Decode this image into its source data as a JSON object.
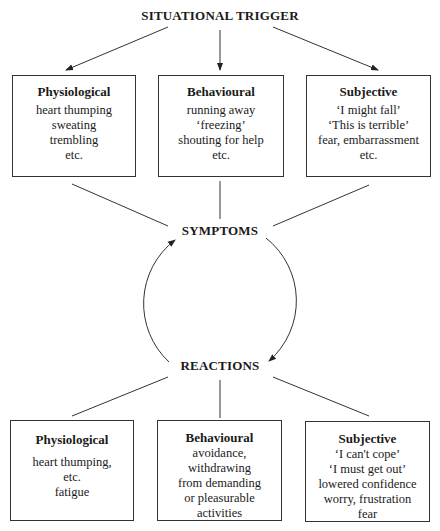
{
  "diagram": {
    "trigger": "SITUATIONAL TRIGGER",
    "symptoms": "SYMPTOMS",
    "reactions": "REACTIONS",
    "top_boxes": [
      {
        "heading": "Physiological",
        "lines": [
          "heart thumping",
          "sweating",
          "trembling",
          "etc."
        ]
      },
      {
        "heading": "Behavioural",
        "lines": [
          "running away",
          "‘freezing’",
          "shouting for help",
          "etc."
        ]
      },
      {
        "heading": "Subjective",
        "lines": [
          "‘I might fall’",
          "‘This is terrible’",
          "fear, embarrassment",
          "etc."
        ]
      }
    ],
    "bottom_boxes": [
      {
        "heading": "Physiological",
        "lines": [
          "heart thumping,",
          "etc.",
          "fatigue"
        ]
      },
      {
        "heading": "Behavioural",
        "lines": [
          "avoidance,",
          "withdrawing",
          "from demanding",
          "or pleasurable",
          "activities"
        ]
      },
      {
        "heading": "Subjective",
        "lines": [
          "‘I can't cope’",
          "‘I must get out’",
          "lowered confidence",
          "worry, frustration",
          "fear"
        ]
      }
    ],
    "colors": {
      "line": "#333333",
      "text": "#1a1a1a",
      "background": "#ffffff"
    }
  }
}
